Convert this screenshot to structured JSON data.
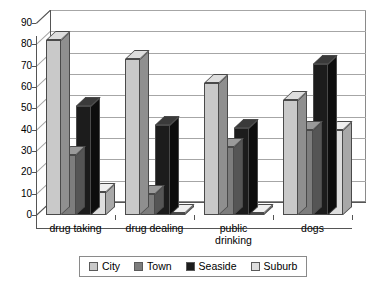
{
  "chart_data": {
    "type": "bar",
    "title": "",
    "subtitle": "",
    "xlabel": "",
    "ylabel": "",
    "ylim": [
      0,
      90
    ],
    "ytick_step": 10,
    "yticks": [
      0,
      10,
      20,
      30,
      40,
      50,
      60,
      70,
      80,
      90
    ],
    "grid": true,
    "three_d": true,
    "legend_position": "bottom",
    "categories": [
      "drug taking",
      "drug dealing",
      "public drinking",
      "dogs"
    ],
    "category_label_lines": [
      [
        "drug taking"
      ],
      [
        "drug dealing"
      ],
      [
        "public",
        "drinking"
      ],
      [
        "dogs"
      ]
    ],
    "series": [
      {
        "name": "City",
        "color": "#c9c9c9",
        "side_color": "#8f8f8f",
        "top_color": "#dedede",
        "values": [
          82,
          73,
          62,
          54
        ]
      },
      {
        "name": "Town",
        "color": "#7d7d7d",
        "side_color": "#555555",
        "top_color": "#9a9a9a",
        "values": [
          28,
          10,
          32,
          40
        ]
      },
      {
        "name": "Seaside",
        "color": "#1c1c1c",
        "side_color": "#0d0d0d",
        "top_color": "#3a3a3a",
        "values": [
          51,
          42,
          41,
          71
        ]
      },
      {
        "name": "Suburb",
        "color": "#dedede",
        "side_color": "#a8a8a8",
        "top_color": "#efefef",
        "values": [
          11,
          1,
          1,
          40
        ]
      }
    ]
  },
  "legend": {
    "items": [
      {
        "label": "City"
      },
      {
        "label": "Town"
      },
      {
        "label": "Seaside"
      },
      {
        "label": "Suburb"
      }
    ]
  },
  "colors": {
    "plot_border": "#8a8a8a",
    "gridline": "#a6a6a6",
    "axis": "#555555",
    "background": "#ffffff",
    "text": "#000000"
  }
}
